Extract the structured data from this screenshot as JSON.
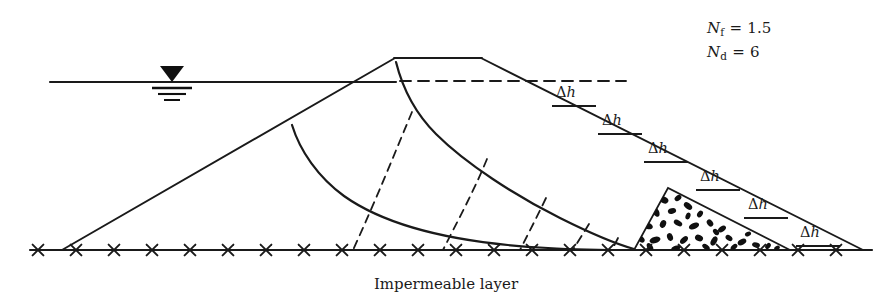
{
  "figure": {
    "title_caption": "Impermeable layer",
    "kind": "seepage-flow-net-earth-dam",
    "ink_color": "#1a1a1a",
    "background_color": "#ffffff"
  },
  "parameters": [
    {
      "symbol": "N",
      "subscript": "f",
      "equals": "=",
      "value": "1.5",
      "name": "number-of-flow-channels"
    },
    {
      "symbol": "N",
      "subscript": "d",
      "equals": "=",
      "value": "6",
      "name": "number-of-potential-drops"
    }
  ],
  "head_loss_labels": [
    {
      "delta": "Δ",
      "h": "h",
      "x": 556,
      "y": 84,
      "tick_x": 552,
      "tick_y": 106,
      "tick_w": 44
    },
    {
      "delta": "Δ",
      "h": "h",
      "x": 602,
      "y": 112,
      "tick_x": 598,
      "tick_y": 134,
      "tick_w": 44
    },
    {
      "delta": "Δ",
      "h": "h",
      "x": 648,
      "y": 140,
      "tick_x": 644,
      "tick_y": 162,
      "tick_w": 44
    },
    {
      "delta": "Δ",
      "h": "h",
      "x": 700,
      "y": 168,
      "tick_x": 696,
      "tick_y": 190,
      "tick_w": 44
    },
    {
      "delta": "Δ",
      "h": "h",
      "x": 748,
      "y": 196,
      "tick_x": 744,
      "tick_y": 218,
      "tick_w": 44
    },
    {
      "delta": "Δ",
      "h": "h",
      "x": 800,
      "y": 224,
      "tick_x": 796,
      "tick_y": 246,
      "tick_w": 44
    }
  ],
  "water_table_symbol": {
    "name": "water-table-triangle",
    "apex_x": 172,
    "surface_y": 82
  },
  "geometry": {
    "reservoir_water_line": {
      "x1": 50,
      "y1": 82,
      "x2": 395,
      "y2": 82
    },
    "dashed_tailwater_line": {
      "x1": 400,
      "y1": 81,
      "x2": 626,
      "y2": 81
    },
    "base_line": {
      "x1": 30,
      "y1": 250,
      "x2": 872,
      "y2": 250
    },
    "upstream_slope": {
      "x1": 62,
      "y1": 250,
      "x2": 395,
      "y2": 58
    },
    "crest": {
      "x1": 395,
      "y1": 58,
      "x2": 481,
      "y2": 58
    },
    "downstream_slope": {
      "x1": 481,
      "y1": 58,
      "x2": 862,
      "y2": 250
    },
    "rock_toe_drain": {
      "left_x": 634,
      "apex_x": 668,
      "apex_y": 188,
      "right_x": 790,
      "base_y": 250
    }
  },
  "base_marks": {
    "name": "impermeable-layer-hatch",
    "symbol": "x",
    "count": 22,
    "start_x": 38,
    "spacing": 38
  },
  "flow_lines": [
    {
      "name": "top-flow-line-phreatic-surface"
    },
    {
      "name": "lower-flow-line"
    }
  ],
  "equipotential_lines": [
    {
      "name": "equipotential-1",
      "base_x": 353
    },
    {
      "name": "equipotential-2",
      "base_x": 443
    },
    {
      "name": "equipotential-3",
      "base_x": 520
    },
    {
      "name": "equipotential-4",
      "base_x": 573
    },
    {
      "name": "equipotential-5",
      "base_x": 612
    }
  ]
}
